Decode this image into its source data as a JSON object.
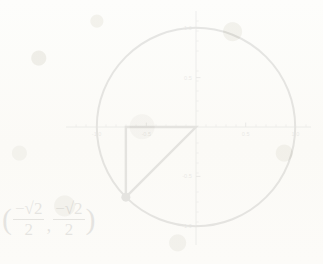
{
  "figure": {
    "title": "",
    "background_color": "#fdfdfb",
    "ink_color": "#111111"
  },
  "chart_data": {
    "type": "scatter",
    "title": "",
    "xlabel": "",
    "ylabel": "",
    "xlim": [
      -1.08,
      1.08
    ],
    "ylim": [
      -1.08,
      1.08
    ],
    "grid": false,
    "legend": null,
    "x_tick_labels": [
      "-1.0",
      "-0.5",
      "0.5",
      "1.0"
    ],
    "x_tick_values": [
      -1.0,
      -0.5,
      0.5,
      1.0
    ],
    "y_tick_labels": [
      "-1.0",
      "-0.5",
      "0.5",
      "1.0"
    ],
    "y_tick_values": [
      -1.0,
      -0.5,
      0.5,
      1.0
    ],
    "minor_tick_step": 0.1,
    "shapes": [
      {
        "name": "unit-circle",
        "kind": "circle",
        "center": [
          0,
          0
        ],
        "radius": 1.0,
        "stroke": "#111111",
        "stroke_width": 2.0,
        "fill": "none"
      },
      {
        "name": "reference-triangle",
        "kind": "polyline",
        "points": [
          [
            0,
            0
          ],
          [
            -0.7071,
            0
          ],
          [
            -0.7071,
            -0.7071
          ],
          [
            0,
            0
          ]
        ],
        "stroke": "#111111",
        "stroke_width": 2.4,
        "fill": "none"
      }
    ],
    "points": [
      {
        "name": "terminal-point",
        "x": -0.7071,
        "y": -0.7071,
        "marker": "filled-circle",
        "marker_size": 9,
        "color": "#111111",
        "angle_degrees": 225,
        "label": "(-sqrt(2)/2, -sqrt(2)/2)"
      }
    ]
  },
  "coordinate_label": {
    "open_paren": "(",
    "comma": ",",
    "close_paren": ")",
    "first": {
      "numerator_sign": "−",
      "numerator_radical": "√2",
      "denominator": "2"
    },
    "second": {
      "numerator_sign": "−",
      "numerator_radical": "√2",
      "denominator": "2"
    }
  }
}
